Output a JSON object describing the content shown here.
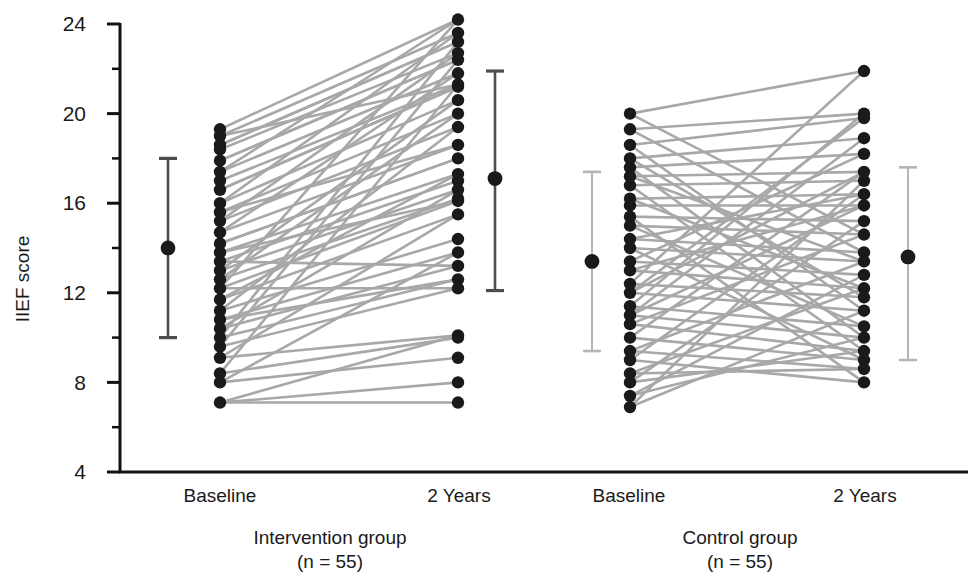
{
  "chart_data": {
    "type": "line",
    "subtype": "paired-slope-chart-with-error-bars",
    "title": "",
    "xlabel": "",
    "ylabel": "IIEF score",
    "ylim": [
      4,
      24
    ],
    "yticks": [
      4,
      8,
      12,
      16,
      20,
      24
    ],
    "yticklabels": [
      "4",
      "8",
      "12",
      "16",
      "20",
      "24"
    ],
    "minor_yticks": [
      6,
      10,
      14,
      18,
      22
    ],
    "grid": false,
    "legend": null,
    "x_positions": [
      1,
      2,
      3,
      4
    ],
    "xticklabels": [
      "Baseline",
      "2 Years",
      "Baseline",
      "2 Years"
    ],
    "groups": [
      {
        "name": "Intervention group",
        "n_label": "(n = 55)",
        "n": 55,
        "baseline_label": "Baseline",
        "followup_label": "2 Years",
        "mean_baseline": 14.0,
        "ci_baseline": [
          10.0,
          18.0
        ],
        "mean_followup": 17.1,
        "ci_followup": [
          12.1,
          21.9
        ],
        "pairs": [
          [
            19.3,
            24.2
          ],
          [
            19.0,
            23.6
          ],
          [
            18.6,
            23.2
          ],
          [
            18.4,
            22.7
          ],
          [
            17.9,
            22.4
          ],
          [
            17.4,
            21.8
          ],
          [
            17.0,
            21.3
          ],
          [
            16.6,
            21.2
          ],
          [
            16.0,
            20.6
          ],
          [
            15.6,
            20.0
          ],
          [
            15.2,
            19.4
          ],
          [
            14.7,
            18.6
          ],
          [
            14.2,
            18.0
          ],
          [
            13.8,
            17.3
          ],
          [
            13.4,
            17.0
          ],
          [
            13.0,
            16.6
          ],
          [
            12.6,
            16.2
          ],
          [
            12.2,
            16.1
          ],
          [
            11.7,
            15.5
          ],
          [
            11.2,
            14.4
          ],
          [
            10.8,
            13.8
          ],
          [
            10.4,
            13.2
          ],
          [
            10.0,
            12.6
          ],
          [
            9.6,
            12.2
          ],
          [
            9.1,
            10.1
          ],
          [
            8.4,
            10.0
          ],
          [
            8.0,
            9.1
          ],
          [
            7.1,
            8.0
          ],
          [
            7.1,
            7.1
          ],
          [
            12.2,
            24.2
          ],
          [
            10.0,
            23.2
          ],
          [
            9.6,
            22.4
          ],
          [
            8.4,
            21.3
          ],
          [
            13.0,
            20.6
          ],
          [
            11.2,
            19.4
          ],
          [
            14.7,
            21.8
          ],
          [
            13.8,
            16.1
          ],
          [
            12.6,
            20.0
          ],
          [
            16.0,
            23.6
          ],
          [
            15.2,
            22.7
          ],
          [
            17.4,
            24.2
          ],
          [
            18.6,
            23.2
          ],
          [
            11.7,
            17.3
          ],
          [
            10.4,
            16.6
          ],
          [
            16.6,
            21.2
          ],
          [
            14.2,
            18.0
          ],
          [
            12.2,
            12.2
          ],
          [
            13.4,
            13.2
          ],
          [
            19.0,
            21.3
          ],
          [
            10.8,
            12.6
          ],
          [
            9.1,
            15.5
          ],
          [
            8.0,
            13.8
          ],
          [
            17.9,
            22.4
          ],
          [
            15.6,
            18.6
          ],
          [
            7.1,
            10.1
          ]
        ]
      },
      {
        "name": "Control group",
        "n_label": "(n = 55)",
        "n": 55,
        "baseline_label": "Baseline",
        "followup_label": "2 Years",
        "mean_baseline": 13.4,
        "ci_baseline": [
          9.4,
          17.4
        ],
        "mean_followup": 13.6,
        "ci_followup": [
          9.0,
          17.6
        ],
        "pairs": [
          [
            20.0,
            21.9
          ],
          [
            19.3,
            20.0
          ],
          [
            18.6,
            19.8
          ],
          [
            18.0,
            18.9
          ],
          [
            17.6,
            18.2
          ],
          [
            17.2,
            17.4
          ],
          [
            16.8,
            17.0
          ],
          [
            16.2,
            16.4
          ],
          [
            15.9,
            15.9
          ],
          [
            15.4,
            15.2
          ],
          [
            15.0,
            14.6
          ],
          [
            14.4,
            13.8
          ],
          [
            14.0,
            13.4
          ],
          [
            13.4,
            12.8
          ],
          [
            13.0,
            12.2
          ],
          [
            12.4,
            11.8
          ],
          [
            12.0,
            11.2
          ],
          [
            11.4,
            10.5
          ],
          [
            11.0,
            10.0
          ],
          [
            10.6,
            9.4
          ],
          [
            10.0,
            9.0
          ],
          [
            9.4,
            8.6
          ],
          [
            9.0,
            8.0
          ],
          [
            8.4,
            8.6
          ],
          [
            8.0,
            9.4
          ],
          [
            7.4,
            10.0
          ],
          [
            6.9,
            11.2
          ],
          [
            9.0,
            16.4
          ],
          [
            10.0,
            17.4
          ],
          [
            11.0,
            18.9
          ],
          [
            12.0,
            19.8
          ],
          [
            13.0,
            15.9
          ],
          [
            14.0,
            9.0
          ],
          [
            15.0,
            10.5
          ],
          [
            16.2,
            12.2
          ],
          [
            17.2,
            13.4
          ],
          [
            18.0,
            11.8
          ],
          [
            19.3,
            13.8
          ],
          [
            20.0,
            14.6
          ],
          [
            8.0,
            15.2
          ],
          [
            7.4,
            12.8
          ],
          [
            6.9,
            17.0
          ],
          [
            11.4,
            20.0
          ],
          [
            12.4,
            21.9
          ],
          [
            13.4,
            18.2
          ],
          [
            14.4,
            16.4
          ],
          [
            15.4,
            8.0
          ],
          [
            16.8,
            9.4
          ],
          [
            17.6,
            10.0
          ],
          [
            18.6,
            11.2
          ],
          [
            9.4,
            13.4
          ],
          [
            10.6,
            14.6
          ],
          [
            8.4,
            12.2
          ],
          [
            11.0,
            15.9
          ],
          [
            12.0,
            17.4
          ]
        ]
      }
    ],
    "colors": {
      "line": "#a8a8a8",
      "point": "#1a1a1a",
      "errorbar_intervention": "#4d4d4d",
      "errorbar_control": "#b5b5b5",
      "axis": "#111111",
      "background": "#ffffff"
    }
  },
  "axis": {
    "ylabel": "IIEF score",
    "ytick_labels": [
      "24",
      "20",
      "16",
      "12",
      "8",
      "4"
    ]
  },
  "xaxis": {
    "ticks": [
      {
        "label": "Baseline"
      },
      {
        "label": "2 Years"
      },
      {
        "label": "Baseline"
      },
      {
        "label": "2 Years"
      }
    ]
  },
  "groups_captions": [
    {
      "name": "Intervention group",
      "n_label": "(n = 55)"
    },
    {
      "name": "Control group",
      "n_label": "(n = 55)"
    }
  ]
}
